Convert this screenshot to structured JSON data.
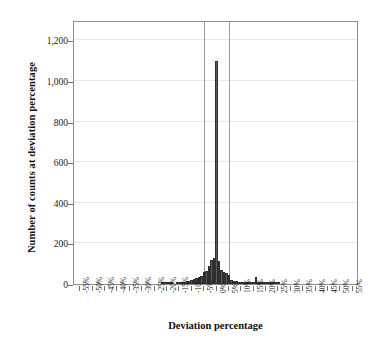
{
  "chart_data": {
    "type": "bar",
    "title": "",
    "subtitle": "",
    "xlabel": "Deviation percentage",
    "ylabel": "Number of counts at deviation percentage",
    "xlim": [
      -57.5,
      57.5
    ],
    "ylim": [
      0,
      1300
    ],
    "grid": true,
    "legend": null,
    "legend_position": "none",
    "bar_color": "#5b5b5b",
    "bar_edge_color": "#2f2f2f",
    "frame_color": "#8e8e8e",
    "grid_color": "#e9e9e9",
    "reference_line_color": "#9a9a9a",
    "reference_lines": [
      -5,
      5
    ],
    "y_ticks": [
      0,
      200,
      400,
      600,
      800,
      1000,
      1200
    ],
    "y_tick_labels": [
      "0",
      "200",
      "400",
      "600",
      "800",
      "1,000",
      "1,200"
    ],
    "x_ticks": [
      -55,
      -50,
      -45,
      -40,
      -35,
      -30,
      -25,
      -20,
      -15,
      -10,
      -5,
      0,
      5,
      10,
      15,
      20,
      25,
      30,
      35,
      40,
      45,
      50,
      55
    ],
    "x_tick_labels": [
      "-55%",
      "-50%",
      "-45%",
      "-40%",
      "-35%",
      "-30%",
      "-25%",
      "-20%",
      "-15%",
      "-10%",
      "-5%",
      "0%",
      "5%",
      "10%",
      "15%",
      "20%",
      "25%",
      "30%",
      "35%",
      "40%",
      "45%",
      "50%",
      "55%"
    ],
    "bin_width": 1,
    "x": [
      -55,
      -54,
      -53,
      -52,
      -51,
      -50,
      -49,
      -48,
      -47,
      -46,
      -45,
      -44,
      -43,
      -42,
      -41,
      -40,
      -39,
      -38,
      -37,
      -36,
      -35,
      -34,
      -33,
      -32,
      -31,
      -30,
      -29,
      -28,
      -27,
      -26,
      -25,
      -24,
      -23,
      -22,
      -21,
      -20,
      -19,
      -18,
      -17,
      -16,
      -15,
      -14,
      -13,
      -12,
      -11,
      -10,
      -9,
      -8,
      -7,
      -6,
      -5,
      -4,
      -3,
      -2,
      -1,
      0,
      1,
      2,
      3,
      4,
      5,
      6,
      7,
      8,
      9,
      10,
      11,
      12,
      13,
      14,
      15,
      16,
      17,
      18,
      19,
      20,
      21,
      22,
      23,
      24,
      25,
      26,
      27,
      28,
      29,
      30,
      31,
      32,
      33,
      34,
      35,
      36,
      37,
      38,
      39,
      40,
      41,
      42,
      43,
      44,
      45,
      46,
      47,
      48,
      49,
      50,
      51,
      52,
      53,
      54,
      55
    ],
    "values": [
      0,
      0,
      0,
      0,
      0,
      0,
      0,
      0,
      0,
      0,
      0,
      0,
      0,
      0,
      0,
      0,
      0,
      0,
      0,
      0,
      0,
      0,
      0,
      0,
      0,
      0,
      0,
      0,
      0,
      0,
      0,
      0,
      0,
      2,
      3,
      6,
      3,
      2,
      0,
      4,
      5,
      6,
      10,
      14,
      16,
      20,
      26,
      30,
      34,
      40,
      58,
      66,
      88,
      120,
      128,
      1100,
      112,
      68,
      60,
      52,
      46,
      20,
      16,
      14,
      12,
      10,
      8,
      6,
      5,
      4,
      4,
      35,
      4,
      3,
      2,
      2,
      2,
      1,
      1,
      1,
      1,
      0,
      0,
      0,
      0,
      0,
      0,
      0,
      0,
      0,
      0,
      0,
      0,
      0,
      0,
      0,
      0,
      0,
      0,
      0,
      0,
      0,
      0,
      0,
      0,
      0,
      0,
      0,
      0,
      0,
      0
    ],
    "peak": {
      "x": 0,
      "value": 1100
    },
    "notable_points": [
      {
        "x": 0,
        "value": 1100,
        "note": "central spike"
      },
      {
        "x": -1,
        "value": 128,
        "note": "left shoulder"
      },
      {
        "x": 1,
        "value": 112,
        "note": "right shoulder"
      },
      {
        "x": 16,
        "value": 35,
        "note": "isolated outlier bar near 15%"
      }
    ]
  }
}
